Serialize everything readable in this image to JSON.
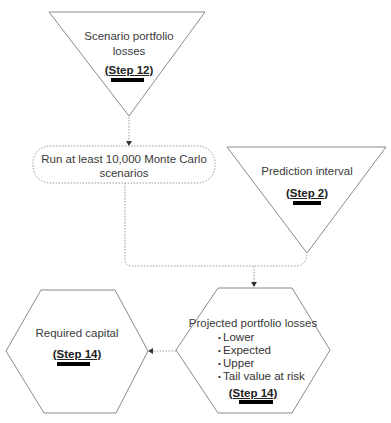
{
  "nodes": {
    "scenario_losses": {
      "shape": "inverted-triangle",
      "label": "Scenario portfolio losses",
      "label_line1": "Scenario portfolio",
      "label_line2": "losses",
      "step": "(Step 12)"
    },
    "monte_carlo": {
      "shape": "rounded-rectangle-dotted",
      "label_line1": "Run at least 10,000 Monte Carlo",
      "label_line2": "scenarios"
    },
    "prediction_interval": {
      "shape": "inverted-triangle",
      "label": "Prediction interval",
      "step": "(Step 2)"
    },
    "projected_losses": {
      "shape": "hexagon",
      "label": "Projected portfolio losses",
      "bullets": [
        "Lower",
        "Expected",
        "Upper",
        "Tail value at risk"
      ],
      "step": "(Step 14)"
    },
    "required_capital": {
      "shape": "hexagon",
      "label": "Required capital",
      "step": "(Step 14)"
    }
  },
  "edges": [
    {
      "from": "scenario_losses",
      "to": "monte_carlo",
      "style": "dotted-arrow"
    },
    {
      "from": "monte_carlo",
      "to": "projected_losses",
      "style": "dotted-merge"
    },
    {
      "from": "prediction_interval",
      "to": "projected_losses",
      "style": "dotted-merge"
    },
    {
      "from": "projected_losses",
      "to": "required_capital",
      "style": "dotted-arrow"
    }
  ],
  "colors": {
    "stroke": "#8a8a8a",
    "dotted": "#9a9a9a",
    "bar": "#000000"
  }
}
